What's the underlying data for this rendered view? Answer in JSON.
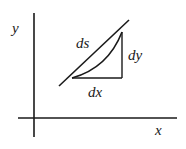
{
  "diagram": {
    "labels": {
      "y_axis": "y",
      "x_axis": "x",
      "arc_length": "ds",
      "rise": "dy",
      "run": "dx"
    },
    "colors": {
      "stroke": "#1a1a1a",
      "background": "#ffffff"
    }
  }
}
